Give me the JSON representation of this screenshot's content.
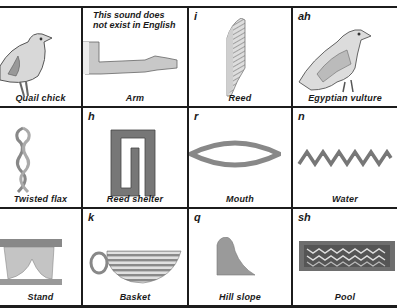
{
  "cells": [
    {
      "sound": "",
      "label": "Quail chick",
      "icon": "quail-chick-icon"
    },
    {
      "sound": "",
      "label": "Arm",
      "note_line1": "This sound does",
      "note_line2": "not exist in English",
      "icon": "arm-icon"
    },
    {
      "sound": "i",
      "label": "Reed",
      "icon": "reed-icon"
    },
    {
      "sound": "ah",
      "label": "Egyptian vulture",
      "icon": "egyptian-vulture-icon"
    },
    {
      "sound": "",
      "label": "Twisted flax",
      "icon": "twisted-flax-icon"
    },
    {
      "sound": "h",
      "label": "Reed shelter",
      "icon": "reed-shelter-icon"
    },
    {
      "sound": "r",
      "label": "Mouth",
      "icon": "mouth-icon"
    },
    {
      "sound": "n",
      "label": "Water",
      "icon": "water-icon"
    },
    {
      "sound": "",
      "label": "Stand",
      "icon": "stand-icon"
    },
    {
      "sound": "k",
      "label": "Basket",
      "icon": "basket-icon"
    },
    {
      "sound": "q",
      "label": "Hill slope",
      "icon": "hill-slope-icon"
    },
    {
      "sound": "sh",
      "label": "Pool",
      "icon": "pool-icon"
    }
  ]
}
